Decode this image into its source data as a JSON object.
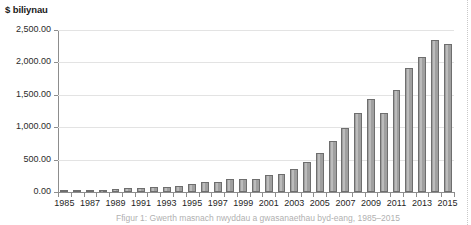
{
  "figure": {
    "axis_title": "$ biliynau",
    "caption": "Ffigur 1: Gwerth masnach nwyddau a gwasanaethau byd-eang, 1985–2015",
    "background_color": "#ffffff",
    "bar_fill_color": "#a0a0a0",
    "bar_border_color": "#6e6e6e",
    "gridline_color": "#e3e3e3",
    "axis_color": "#8d8d8d",
    "page_edge_icon": "dotted-page-edge"
  },
  "chart_data": {
    "type": "bar",
    "title": "",
    "subtitle": "",
    "xlabel": "",
    "ylabel": "$ biliynau",
    "ylim": [
      0,
      2500
    ],
    "y_ticks": [
      0,
      500,
      1000,
      1500,
      2000,
      2500
    ],
    "y_tick_labels": [
      "0.00",
      "500.00",
      "1,000.00",
      "1,500.00",
      "2,000.00",
      "2,500.00"
    ],
    "grid": true,
    "legend": null,
    "categories": [
      "1985",
      "1986",
      "1987",
      "1988",
      "1989",
      "1990",
      "1991",
      "1992",
      "1993",
      "1994",
      "1995",
      "1996",
      "1997",
      "1998",
      "1999",
      "2000",
      "2001",
      "2002",
      "2003",
      "2004",
      "2005",
      "2006",
      "2007",
      "2008",
      "2009",
      "2010",
      "2011",
      "2012",
      "2013",
      "2014",
      "2015"
    ],
    "x_tick_labels": [
      "1985",
      "1987",
      "1989",
      "1991",
      "1993",
      "1995",
      "1997",
      "1999",
      "2001",
      "2003",
      "2005",
      "2007",
      "2009",
      "2011",
      "2013",
      "2015"
    ],
    "values": [
      20,
      28,
      22,
      38,
      45,
      58,
      65,
      78,
      82,
      90,
      130,
      160,
      162,
      195,
      198,
      205,
      265,
      285,
      350,
      465,
      605,
      780,
      995,
      1220,
      1440,
      1220,
      1580,
      1920,
      2090,
      2350,
      2290
    ]
  }
}
